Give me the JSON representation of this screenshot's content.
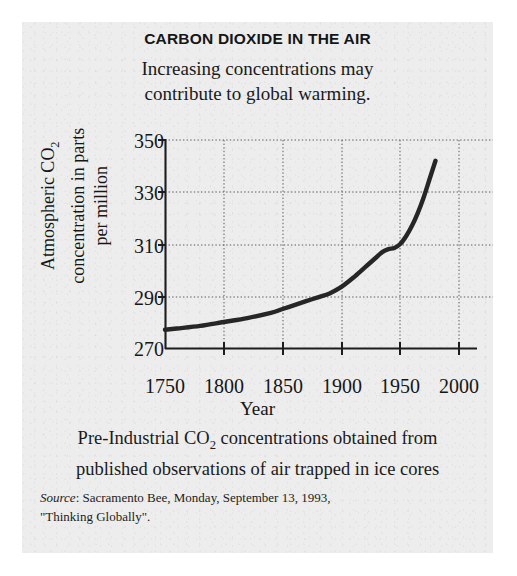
{
  "figure": {
    "title": "CARBON DIOXIDE IN THE AIR",
    "subtitle_line1": "Increasing concentrations may",
    "subtitle_line2": "contribute to global warming.",
    "caption_line1": "Pre-Industrial CO₂ concentrations obtained from",
    "caption_line2": "published observations of air trapped in ice cores",
    "source_label": "Source",
    "source_line1": ": Sacramento Bee, Monday, September 13, 1993,",
    "source_line2": "\"Thinking Globally\".",
    "background_color": "#ededed",
    "ink_color": "#222222"
  },
  "axis_titles": {
    "y_line1": "Atmospheric CO₂",
    "y_line2": "concentration in parts",
    "y_line3": "per million",
    "x": "Year"
  },
  "chart_data": {
    "type": "line",
    "title": "CARBON DIOXIDE IN THE AIR",
    "subtitle": "Increasing concentrations may contribute to global warming.",
    "xlabel": "Year",
    "ylabel": "Atmospheric CO2 concentration in parts per million",
    "xlim": [
      1750,
      2000
    ],
    "ylim": [
      270,
      350
    ],
    "xticks": [
      1750,
      1800,
      1850,
      1900,
      1950,
      2000
    ],
    "yticks": [
      270,
      290,
      310,
      330,
      350
    ],
    "xtick_labels": [
      "1750",
      "1800",
      "1850",
      "1900",
      "1950",
      "2000"
    ],
    "ytick_labels": [
      "270",
      "290",
      "310",
      "330",
      "350"
    ],
    "grid": "dotted",
    "legend": "none",
    "series": [
      {
        "name": "Atmospheric CO2",
        "units": "ppm",
        "x": [
          1750,
          1760,
          1780,
          1800,
          1820,
          1840,
          1850,
          1860,
          1870,
          1880,
          1890,
          1900,
          1910,
          1920,
          1930,
          1935,
          1940,
          1945,
          1950,
          1955,
          1960,
          1965,
          1970,
          1975,
          1980
        ],
        "y": [
          277,
          277.5,
          278.5,
          280,
          281.5,
          283.5,
          285,
          286.5,
          288,
          289.5,
          291,
          293.5,
          297,
          301,
          305,
          307,
          308,
          308.5,
          310,
          313,
          317,
          322,
          328,
          335,
          342
        ]
      }
    ]
  }
}
